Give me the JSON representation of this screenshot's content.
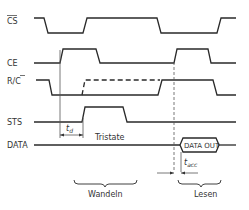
{
  "diagram": {
    "type": "timing-diagram",
    "signals": [
      {
        "id": "cs",
        "label": "CS",
        "overbar": "CS"
      },
      {
        "id": "ce",
        "label": "CE"
      },
      {
        "id": "rc",
        "label": "R/C",
        "overbar_part": "C"
      },
      {
        "id": "sts",
        "label": "STS"
      },
      {
        "id": "data",
        "label": "DATA"
      }
    ],
    "annotations": {
      "td": "t",
      "td_sub": "d",
      "tacc": "t",
      "tacc_sub": "acc",
      "tristate": "Tristate",
      "data_out": "DATA OUT",
      "phase_convert": "Wandeln",
      "phase_read": "Lesen"
    },
    "colors": {
      "line": "#2a2a2a",
      "text": "#333333",
      "background": "#ffffff"
    }
  }
}
